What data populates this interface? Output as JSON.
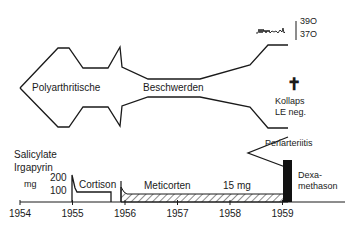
{
  "diagram": {
    "symptom_band": {
      "label_left": "Polyarthritische",
      "label_right": "Beschwerden"
    },
    "temperature": {
      "high_label": "39O",
      "low_label": "37O"
    },
    "death_marker": {
      "symbol": "✝",
      "label_line1": "Kollaps",
      "label_line2": "LE neg."
    },
    "complication": {
      "label": "Periarteriitis"
    },
    "medication_axis": {
      "drug_label_line1": "Salicylate",
      "drug_label_line2": "Irgapyrin",
      "unit_label": "mg",
      "dose_ticks": [
        "200",
        "100"
      ],
      "years": [
        "1954",
        "1955",
        "1956",
        "1957",
        "1958",
        "1959"
      ]
    },
    "treatments": [
      {
        "name": "Cortison",
        "start_year": 1955.0,
        "end_year": 1955.8,
        "initial_dose_mg": 200,
        "maintenance_dose_mg": 100,
        "pattern": "open"
      },
      {
        "name": "Meticorten",
        "dose_label": "15 mg",
        "start_year": 1956.0,
        "end_year": 1959.1,
        "pattern": "hatched"
      },
      {
        "name_line1": "Dexa-",
        "name_line2": "methason",
        "start_year": 1959.1,
        "end_year": 1959.25,
        "pattern": "solid"
      }
    ]
  }
}
